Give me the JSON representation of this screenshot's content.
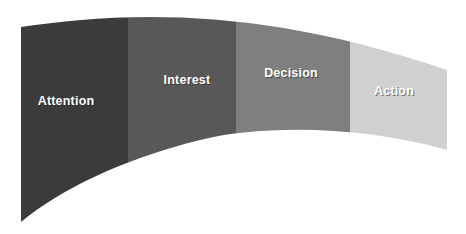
{
  "diagram": {
    "type": "curved-funnel-band",
    "stages": [
      {
        "label": "Attention",
        "color": "#3b3b3b"
      },
      {
        "label": "Interest",
        "color": "#585858"
      },
      {
        "label": "Decision",
        "color": "#7f7f7f"
      },
      {
        "label": "Action",
        "color": "#d0d0d0"
      }
    ]
  }
}
